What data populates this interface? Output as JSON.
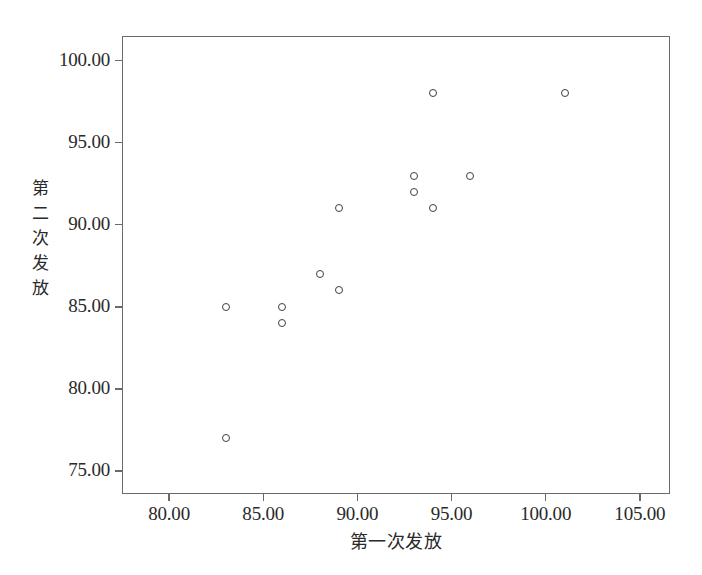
{
  "chart_data": {
    "type": "scatter",
    "title": "",
    "xlabel": "第一次发放",
    "ylabel": "第二次发放",
    "xlim": [
      77.5,
      106.6
    ],
    "ylim": [
      73.6,
      101.5
    ],
    "grid": false,
    "legend": null,
    "x_tick_labels": [
      "80.00",
      "85.00",
      "90.00",
      "95.00",
      "100.00",
      "105.00"
    ],
    "x_tick_values": [
      80,
      85,
      90,
      95,
      100,
      105
    ],
    "y_tick_labels": [
      "100.00",
      "95.00",
      "90.00",
      "85.00",
      "80.00",
      "75.00"
    ],
    "y_tick_values": [
      100,
      95,
      90,
      85,
      80,
      75
    ],
    "marker": "open-circle",
    "marker_color": "#3d3d47",
    "points": [
      {
        "x": 83,
        "y": 85
      },
      {
        "x": 83,
        "y": 77
      },
      {
        "x": 86,
        "y": 85
      },
      {
        "x": 86,
        "y": 84
      },
      {
        "x": 88,
        "y": 87
      },
      {
        "x": 89,
        "y": 91
      },
      {
        "x": 89,
        "y": 86
      },
      {
        "x": 93,
        "y": 93
      },
      {
        "x": 93,
        "y": 92
      },
      {
        "x": 94,
        "y": 98
      },
      {
        "x": 94,
        "y": 91
      },
      {
        "x": 96,
        "y": 93
      },
      {
        "x": 101,
        "y": 98
      }
    ]
  },
  "axes": {
    "x_title": "第一次发放",
    "y_title": "第二次发放"
  },
  "caption": {
    "text": ""
  }
}
